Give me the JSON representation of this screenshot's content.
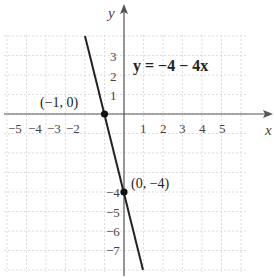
{
  "chart_data": {
    "type": "line",
    "title": "",
    "xlabel": "x",
    "ylabel": "y",
    "xlim": [
      -6,
      7.5
    ],
    "ylim": [
      -8,
      5.5
    ],
    "grid": true,
    "x_tick_labels": [
      "−5",
      "−4",
      "−3",
      "−2",
      "1",
      "2",
      "3",
      "4",
      "5"
    ],
    "y_tick_labels": [
      "3",
      "2",
      "1",
      "−4",
      "−5",
      "−6",
      "−7"
    ],
    "series": [
      {
        "name": "y = −4 − 4x",
        "equation": "y = -4 - 4x",
        "x": [
          -2,
          -1,
          0,
          1
        ],
        "y": [
          4,
          0,
          -4,
          -8
        ]
      }
    ],
    "points": [
      {
        "x": -1,
        "y": 0,
        "label": "(−1, 0)"
      },
      {
        "x": 0,
        "y": -4,
        "label": "(0, −4)"
      }
    ],
    "annotations": [
      "y = −4 − 4x"
    ]
  },
  "labels": {
    "x_axis": "x",
    "y_axis": "y",
    "equation": "y = −4 − 4x",
    "point1": "(−1, 0)",
    "point2": "(0, −4)",
    "xt": [
      "−5",
      "−4",
      "−3",
      "−2",
      "1",
      "2",
      "3",
      "4",
      "5"
    ],
    "yt": [
      "3",
      "2",
      "1",
      "−4",
      "−5",
      "−6",
      "−7"
    ]
  }
}
